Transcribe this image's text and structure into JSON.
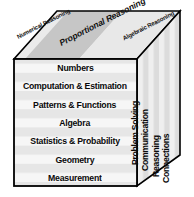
{
  "figure": {
    "name": "mathematics-framework-cube",
    "colors": {
      "outline": "#000000",
      "text": "#0a0a0a",
      "front_face_base": "#f2f2f2",
      "front_face_stripe": "#e4e4e4",
      "top_face_light": "#efefef",
      "top_face_band": "#c8c8c8",
      "side_face_base": "#d8d8d8",
      "side_face_stripe": "#ededed"
    }
  },
  "top_face": {
    "name": "reasoning-face",
    "labels": [
      {
        "id": "numerical",
        "text": "Numerical Reasoning",
        "emphasis": "normal"
      },
      {
        "id": "proportional",
        "text": "Proportional Reasoning",
        "emphasis": "bold-italic"
      },
      {
        "id": "algebraic",
        "text": "Algebraic Reasoning",
        "emphasis": "normal"
      }
    ]
  },
  "front_face": {
    "name": "content-strands-face",
    "items": [
      {
        "label": "Numbers"
      },
      {
        "label": "Computation & Estimation"
      },
      {
        "label": "Patterns & Functions"
      },
      {
        "label": "Algebra"
      },
      {
        "label": "Statistics & Probability"
      },
      {
        "label": "Geometry"
      },
      {
        "label": "Measurement"
      }
    ]
  },
  "side_face": {
    "name": "process-standards-face",
    "items": [
      {
        "label": "Problem Solving"
      },
      {
        "label": "Communication"
      },
      {
        "label": "Reasoning"
      },
      {
        "label": "Connections"
      }
    ]
  }
}
